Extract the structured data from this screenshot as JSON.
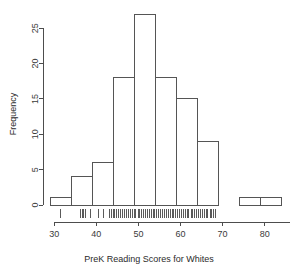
{
  "chart_data": {
    "type": "bar",
    "subtype": "histogram",
    "title": "",
    "xlabel": "PreK Reading Scores for Whites",
    "ylabel": "Frequency",
    "grid": false,
    "legend": false,
    "legend_position": "none",
    "xlim": [
      29,
      86
    ],
    "ylim": [
      0,
      27
    ],
    "xticks": [
      30,
      40,
      50,
      60,
      70,
      80
    ],
    "xtick_labels": [
      "30",
      "40",
      "50",
      "60",
      "70",
      "80"
    ],
    "yticks": [
      0,
      5,
      10,
      15,
      20,
      25
    ],
    "ytick_labels": [
      "0",
      "5",
      "10",
      "15",
      "20",
      "25"
    ],
    "bin_width": 5,
    "bin_edges": [
      29,
      34,
      39,
      44,
      49,
      54,
      59,
      64,
      69,
      74,
      79,
      84
    ],
    "categories": [
      "29-34",
      "34-39",
      "39-44",
      "44-49",
      "49-54",
      "54-59",
      "59-64",
      "64-69",
      "69-74",
      "74-79",
      "79-84"
    ],
    "values": [
      1,
      4,
      6,
      18,
      27,
      18,
      15,
      9,
      0,
      1,
      1
    ],
    "bars": [
      {
        "x0": 29,
        "x1": 34,
        "count": 1
      },
      {
        "x0": 34,
        "x1": 39,
        "count": 4
      },
      {
        "x0": 39,
        "x1": 44,
        "count": 6
      },
      {
        "x0": 44,
        "x1": 49,
        "count": 18
      },
      {
        "x0": 49,
        "x1": 54,
        "count": 27
      },
      {
        "x0": 54,
        "x1": 59,
        "count": 18
      },
      {
        "x0": 59,
        "x1": 64,
        "count": 15
      },
      {
        "x0": 64,
        "x1": 69,
        "count": 9
      },
      {
        "x0": 69,
        "x1": 74,
        "count": 0
      },
      {
        "x0": 74,
        "x1": 79,
        "count": 1
      },
      {
        "x0": 79,
        "x1": 84,
        "count": 1
      }
    ],
    "rug_values": [
      31.5,
      36.2,
      36.6,
      37.0,
      37.4,
      38.6,
      40.4,
      41.6,
      43.2,
      43.6,
      44.0,
      44.4,
      44.9,
      45.3,
      45.8,
      46.2,
      46.7,
      47.1,
      47.6,
      48.0,
      48.5,
      49.0,
      49.4,
      49.9,
      50.3,
      50.8,
      51.2,
      51.7,
      52.1,
      52.6,
      53.0,
      53.5,
      53.9,
      54.4,
      54.8,
      55.3,
      55.7,
      56.2,
      56.6,
      57.1,
      57.5,
      58.0,
      58.4,
      58.9,
      59.3,
      59.8,
      60.2,
      60.7,
      61.1,
      61.6,
      62.0,
      62.5,
      62.9,
      63.4,
      63.8,
      64.3,
      64.7,
      65.2,
      65.6,
      66.1,
      66.5,
      67.0,
      67.4,
      67.9,
      68.3
    ]
  },
  "plot": {
    "background_color": "#ffffff",
    "axis_color": "#4d4d4d",
    "bar_stroke_color": "#555555",
    "bar_fill_color": "#ffffff",
    "text_color": "#2b2b2b"
  }
}
